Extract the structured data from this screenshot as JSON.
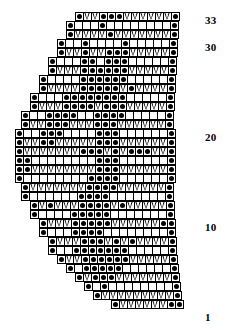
{
  "chart": {
    "type": "knitting-chart",
    "total_rows": 33,
    "max_columns": 20,
    "cell_size_px": 9,
    "grid_line_color": "#000000",
    "cell_background": "#ffffff",
    "symbol_color": "#000000",
    "right_edge_x": 197,
    "top_y": 12,
    "symbols": {
      "dot": "purl-stitch",
      "vee": "slip-stitch-chevron",
      "blank": "knit-stitch"
    },
    "legend_note": "dot = purl, V = slip/chevron, blank = knit",
    "row_labels": [
      {
        "label": "33",
        "row": 33,
        "x": 205,
        "y": 14
      },
      {
        "label": "30",
        "row": 30,
        "x": 205,
        "y": 41
      },
      {
        "label": "20",
        "row": 20,
        "x": 205,
        "y": 131
      },
      {
        "label": "10",
        "row": 10,
        "x": 205,
        "y": 221
      },
      {
        "label": "1",
        "row": 1,
        "x": 205,
        "y": 311
      }
    ],
    "rows": [
      {
        "row": 33,
        "y": 12,
        "start_x": 75,
        "cells": [
          "dot",
          "vee",
          "vee",
          "dot",
          "dot",
          "dot",
          "vee",
          "vee",
          "vee",
          "vee",
          "vee",
          "vee",
          "dot"
        ]
      },
      {
        "row": 32,
        "y": 21,
        "start_x": 66,
        "cells": [
          "dot",
          "blank",
          "blank",
          "blank",
          "dot",
          "blank",
          "blank",
          "blank",
          "blank",
          "blank",
          "blank",
          "blank",
          "blank",
          "dot"
        ]
      },
      {
        "row": 31,
        "y": 30,
        "start_x": 66,
        "cells": [
          "dot",
          "vee",
          "vee",
          "vee",
          "vee",
          "dot",
          "vee",
          "vee",
          "vee",
          "vee",
          "vee",
          "vee",
          "vee",
          "dot"
        ]
      },
      {
        "row": 30,
        "y": 39,
        "start_x": 57,
        "cells": [
          "dot",
          "blank",
          "blank",
          "dot",
          "blank",
          "blank",
          "blank",
          "blank",
          "dot",
          "blank",
          "blank",
          "blank",
          "blank",
          "blank",
          "dot"
        ]
      },
      {
        "row": 29,
        "y": 48,
        "start_x": 57,
        "cells": [
          "dot",
          "vee",
          "vee",
          "dot",
          "vee",
          "vee",
          "dot",
          "dot",
          "dot",
          "vee",
          "vee",
          "vee",
          "vee",
          "vee",
          "dot"
        ]
      },
      {
        "row": 28,
        "y": 57,
        "start_x": 48,
        "cells": [
          "dot",
          "blank",
          "blank",
          "blank",
          "dot",
          "dot",
          "blank",
          "dot",
          "dot",
          "dot",
          "blank",
          "blank",
          "blank",
          "blank",
          "blank",
          "dot"
        ]
      },
      {
        "row": 27,
        "y": 66,
        "start_x": 48,
        "cells": [
          "dot",
          "vee",
          "vee",
          "vee",
          "dot",
          "dot",
          "dot",
          "dot",
          "dot",
          "dot",
          "vee",
          "vee",
          "vee",
          "vee",
          "vee",
          "dot"
        ]
      },
      {
        "row": 26,
        "y": 75,
        "start_x": 39,
        "cells": [
          "dot",
          "blank",
          "blank",
          "blank",
          "blank",
          "dot",
          "dot",
          "dot",
          "dot",
          "dot",
          "dot",
          "blank",
          "blank",
          "blank",
          "blank",
          "blank",
          "dot"
        ]
      },
      {
        "row": 25,
        "y": 84,
        "start_x": 39,
        "cells": [
          "dot",
          "vee",
          "vee",
          "vee",
          "vee",
          "dot",
          "dot",
          "dot",
          "dot",
          "dot",
          "vee",
          "dot",
          "vee",
          "vee",
          "vee",
          "vee",
          "dot"
        ]
      },
      {
        "row": 24,
        "y": 93,
        "start_x": 30,
        "cells": [
          "dot",
          "blank",
          "blank",
          "blank",
          "dot",
          "dot",
          "dot",
          "dot",
          "dot",
          "dot",
          "dot",
          "dot",
          "blank",
          "blank",
          "blank",
          "blank",
          "blank",
          "dot"
        ]
      },
      {
        "row": 23,
        "y": 102,
        "start_x": 30,
        "cells": [
          "dot",
          "vee",
          "vee",
          "vee",
          "dot",
          "dot",
          "dot",
          "dot",
          "vee",
          "dot",
          "dot",
          "dot",
          "vee",
          "vee",
          "vee",
          "vee",
          "vee",
          "dot"
        ]
      },
      {
        "row": 22,
        "y": 111,
        "start_x": 21,
        "cells": [
          "dot",
          "blank",
          "blank",
          "dot",
          "dot",
          "dot",
          "dot",
          "blank",
          "blank",
          "dot",
          "dot",
          "dot",
          "dot",
          "blank",
          "blank",
          "blank",
          "blank",
          "blank",
          "dot"
        ]
      },
      {
        "row": 21,
        "y": 120,
        "start_x": 21,
        "cells": [
          "dot",
          "vee",
          "vee",
          "dot",
          "dot",
          "dot",
          "vee",
          "vee",
          "vee",
          "dot",
          "dot",
          "dot",
          "vee",
          "vee",
          "vee",
          "vee",
          "vee",
          "vee",
          "dot"
        ]
      },
      {
        "row": 20,
        "y": 129,
        "start_x": 15,
        "cells": [
          "dot",
          "blank",
          "blank",
          "dot",
          "dot",
          "dot",
          "blank",
          "blank",
          "blank",
          "blank",
          "dot",
          "dot",
          "dot",
          "blank",
          "blank",
          "blank",
          "blank",
          "blank",
          "blank",
          "dot"
        ]
      },
      {
        "row": 19,
        "y": 138,
        "start_x": 15,
        "cells": [
          "dot",
          "vee",
          "vee",
          "dot",
          "dot",
          "vee",
          "vee",
          "vee",
          "vee",
          "vee",
          "dot",
          "dot",
          "dot",
          "vee",
          "vee",
          "vee",
          "vee",
          "vee",
          "vee",
          "dot"
        ]
      },
      {
        "row": 18,
        "y": 147,
        "start_x": 15,
        "cells": [
          "dot",
          "vee",
          "vee",
          "vee",
          "vee",
          "vee",
          "vee",
          "vee",
          "dot",
          "dot",
          "dot",
          "vee",
          "dot",
          "vee",
          "dot",
          "dot",
          "dot",
          "vee",
          "vee",
          "dot"
        ]
      },
      {
        "row": 17,
        "y": 156,
        "start_x": 15,
        "cells": [
          "dot",
          "dot",
          "blank",
          "blank",
          "blank",
          "blank",
          "blank",
          "blank",
          "blank",
          "blank",
          "dot",
          "dot",
          "dot",
          "blank",
          "blank",
          "blank",
          "blank",
          "blank",
          "blank",
          "dot"
        ]
      },
      {
        "row": 16,
        "y": 165,
        "start_x": 15,
        "cells": [
          "dot",
          "dot",
          "vee",
          "vee",
          "vee",
          "vee",
          "vee",
          "vee",
          "vee",
          "vee",
          "dot",
          "dot",
          "dot",
          "vee",
          "vee",
          "vee",
          "vee",
          "vee",
          "vee",
          "dot"
        ]
      },
      {
        "row": 15,
        "y": 174,
        "start_x": 15,
        "cells": [
          "dot",
          "blank",
          "blank",
          "blank",
          "blank",
          "blank",
          "blank",
          "blank",
          "blank",
          "dot",
          "dot",
          "dot",
          "dot",
          "blank",
          "blank",
          "blank",
          "blank",
          "blank",
          "blank",
          "dot"
        ]
      },
      {
        "row": 14,
        "y": 183,
        "start_x": 21,
        "cells": [
          "dot",
          "vee",
          "vee",
          "vee",
          "vee",
          "vee",
          "vee",
          "vee",
          "dot",
          "dot",
          "dot",
          "dot",
          "vee",
          "vee",
          "vee",
          "vee",
          "vee",
          "vee",
          "dot"
        ]
      },
      {
        "row": 13,
        "y": 192,
        "start_x": 21,
        "cells": [
          "dot",
          "blank",
          "blank",
          "blank",
          "blank",
          "blank",
          "blank",
          "dot",
          "dot",
          "dot",
          "dot",
          "blank",
          "blank",
          "blank",
          "blank",
          "blank",
          "blank",
          "blank",
          "dot"
        ]
      },
      {
        "row": 12,
        "y": 201,
        "start_x": 30,
        "cells": [
          "dot",
          "vee",
          "dot",
          "vee",
          "vee",
          "vee",
          "dot",
          "dot",
          "dot",
          "dot",
          "vee",
          "dot",
          "vee",
          "vee",
          "vee",
          "vee",
          "vee",
          "dot"
        ]
      },
      {
        "row": 11,
        "y": 210,
        "start_x": 30,
        "cells": [
          "dot",
          "blank",
          "blank",
          "blank",
          "blank",
          "dot",
          "dot",
          "dot",
          "dot",
          "dot",
          "blank",
          "blank",
          "blank",
          "blank",
          "blank",
          "blank",
          "blank",
          "dot"
        ]
      },
      {
        "row": 10,
        "y": 219,
        "start_x": 39,
        "cells": [
          "dot",
          "vee",
          "vee",
          "vee",
          "dot",
          "dot",
          "dot",
          "dot",
          "dot",
          "vee",
          "vee",
          "vee",
          "vee",
          "vee",
          "vee",
          "dot",
          "dot"
        ]
      },
      {
        "row": 9,
        "y": 228,
        "start_x": 39,
        "cells": [
          "dot",
          "blank",
          "blank",
          "blank",
          "dot",
          "dot",
          "dot",
          "dot",
          "blank",
          "blank",
          "blank",
          "blank",
          "blank",
          "blank",
          "blank",
          "blank",
          "dot"
        ]
      },
      {
        "row": 8,
        "y": 237,
        "start_x": 48,
        "cells": [
          "dot",
          "vee",
          "vee",
          "vee",
          "dot",
          "dot",
          "dot",
          "vee",
          "dot",
          "vee",
          "dot",
          "vee",
          "vee",
          "vee",
          "vee",
          "dot"
        ]
      },
      {
        "row": 7,
        "y": 246,
        "start_x": 48,
        "cells": [
          "dot",
          "blank",
          "blank",
          "dot",
          "dot",
          "dot",
          "dot",
          "dot",
          "dot",
          "dot",
          "blank",
          "blank",
          "blank",
          "blank",
          "blank",
          "dot"
        ]
      },
      {
        "row": 6,
        "y": 255,
        "start_x": 57,
        "cells": [
          "dot",
          "vee",
          "vee",
          "dot",
          "dot",
          "dot",
          "dot",
          "dot",
          "dot",
          "vee",
          "vee",
          "vee",
          "vee",
          "vee",
          "dot"
        ]
      },
      {
        "row": 5,
        "y": 264,
        "start_x": 66,
        "cells": [
          "dot",
          "blank",
          "dot",
          "dot",
          "dot",
          "dot",
          "dot",
          "blank",
          "blank",
          "blank",
          "blank",
          "blank",
          "blank",
          "dot"
        ]
      },
      {
        "row": 4,
        "y": 273,
        "start_x": 75,
        "cells": [
          "dot",
          "vee",
          "dot",
          "dot",
          "dot",
          "vee",
          "vee",
          "vee",
          "vee",
          "vee",
          "vee",
          "vee",
          "dot"
        ]
      },
      {
        "row": 3,
        "y": 282,
        "start_x": 84,
        "cells": [
          "dot",
          "blank",
          "dot",
          "blank",
          "blank",
          "blank",
          "blank",
          "blank",
          "blank",
          "blank",
          "blank",
          "dot"
        ]
      },
      {
        "row": 2,
        "y": 291,
        "start_x": 93,
        "cells": [
          "dot",
          "vee",
          "vee",
          "vee",
          "vee",
          "vee",
          "vee",
          "vee",
          "vee",
          "vee",
          "dot"
        ]
      },
      {
        "row": 1,
        "y": 300,
        "start_x": 111,
        "cells": [
          "dot",
          "vee",
          "vee",
          "vee",
          "vee",
          "vee",
          "vee",
          "dot",
          "dot"
        ]
      }
    ]
  }
}
